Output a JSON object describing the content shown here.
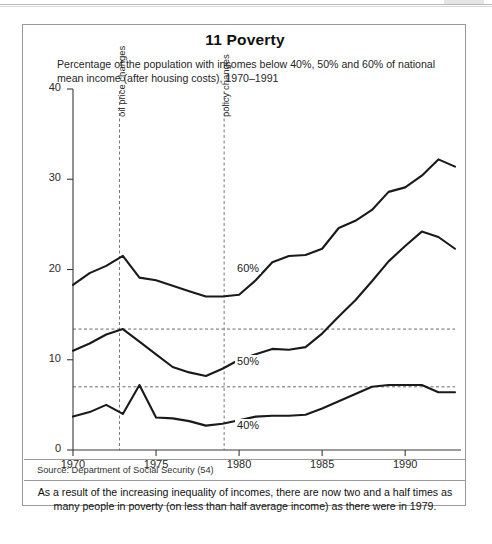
{
  "figure": {
    "title": "11 Poverty",
    "subtitle": "Percentage of the population with incomes below 40%, 50% and 60% of national mean income (after housing costs), 1970–1991",
    "source": "Source: Department of Social Security (54)",
    "caption": "As a result of the increasing inequality of incomes, there are now two and a half times as many people in poverty (on less than half average income) as there were in 1979."
  },
  "chart_data": {
    "type": "line",
    "title": "11 Poverty",
    "subtitle": "Percentage of the population with incomes below 40%, 50% and 60% of national mean income (after housing costs), 1970–1991",
    "xlabel": "",
    "ylabel": "",
    "xlim": [
      1970,
      1993
    ],
    "ylim": [
      0,
      40
    ],
    "grid": false,
    "legend_position": "inline-labels",
    "x_ticks": [
      1970,
      1975,
      1980,
      1985,
      1990
    ],
    "x_tick_labels": [
      "1970",
      "1975",
      "1980",
      "1985",
      "1990"
    ],
    "y_ticks": [
      0,
      10,
      20,
      30,
      40
    ],
    "y_tick_labels": [
      "0",
      "10",
      "20",
      "30",
      "40"
    ],
    "x": [
      1970,
      1971,
      1972,
      1973,
      1974,
      1975,
      1976,
      1977,
      1978,
      1979,
      1980,
      1981,
      1982,
      1983,
      1984,
      1985,
      1986,
      1987,
      1988,
      1989,
      1990,
      1991,
      1992,
      1993
    ],
    "series": [
      {
        "name": "60%",
        "label": "60%",
        "color": "#1a1a1a",
        "values": [
          18.3,
          19.6,
          20.4,
          21.5,
          19.1,
          18.8,
          18.2,
          17.6,
          17.0,
          17.0,
          17.2,
          18.8,
          20.8,
          21.5,
          21.6,
          22.3,
          24.6,
          25.4,
          26.6,
          28.6,
          29.1,
          30.4,
          32.2,
          31.4
        ]
      },
      {
        "name": "50%",
        "label": "50%",
        "color": "#1a1a1a",
        "values": [
          11.0,
          11.8,
          12.8,
          13.4,
          12.0,
          10.6,
          9.2,
          8.6,
          8.2,
          9.0,
          10.0,
          10.6,
          11.2,
          11.1,
          11.4,
          12.9,
          14.8,
          16.6,
          18.7,
          20.9,
          22.6,
          24.2,
          23.6,
          22.3
        ]
      },
      {
        "name": "40%",
        "label": "40%",
        "color": "#1a1a1a",
        "values": [
          3.7,
          4.2,
          5.0,
          4.0,
          7.2,
          3.6,
          3.5,
          3.2,
          2.7,
          2.9,
          3.3,
          3.7,
          3.8,
          3.8,
          3.9,
          4.6,
          5.4,
          6.2,
          7.0,
          7.2,
          7.2,
          7.2,
          6.4,
          6.4
        ]
      }
    ],
    "reference_lines_horizontal": [
      {
        "value": 13.4,
        "style": "dashed",
        "note": "1979 level of 50% line"
      },
      {
        "value": 7.0,
        "style": "dashed",
        "note": "1979-related 40% level"
      }
    ],
    "annotations": [
      {
        "label": "oil price changes",
        "x": 1972.8,
        "style": "dashed-vertical"
      },
      {
        "label": "policy changes",
        "x": 1979.1,
        "style": "dashed-vertical"
      }
    ]
  }
}
